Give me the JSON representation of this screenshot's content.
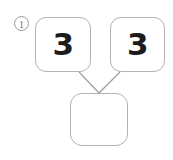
{
  "canvas": {
    "width": 173,
    "height": 160,
    "background": "#ffffff"
  },
  "marker": {
    "label": "1",
    "symbol": "①",
    "name": "problem-number",
    "color": "#6d6d6d"
  },
  "style": {
    "box_border_color": "#b2b2b2",
    "box_fill": "#ffffff",
    "digit_color": "#1c1c1c",
    "connector_color": "#9d9d9d"
  },
  "diagram": {
    "type": "number-bond",
    "nodes": [
      {
        "id": "addend-left",
        "value": "3",
        "filled": true,
        "x": 35,
        "y": 17,
        "w": 56,
        "h": 55
      },
      {
        "id": "addend-right",
        "value": "3",
        "filled": true,
        "x": 110,
        "y": 17,
        "w": 55,
        "h": 55
      },
      {
        "id": "sum",
        "value": "",
        "filled": false,
        "x": 70,
        "y": 93,
        "w": 58,
        "h": 53
      }
    ],
    "connectors": [
      {
        "from": "addend-left",
        "to": "sum",
        "x1": 79,
        "y1": 72,
        "x2": 99,
        "y2": 93
      },
      {
        "from": "addend-right",
        "to": "sum",
        "x1": 120,
        "y1": 72,
        "x2": 99,
        "y2": 93
      }
    ]
  }
}
